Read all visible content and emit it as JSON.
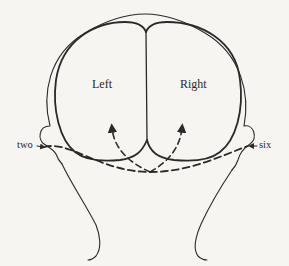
{
  "diagram": {
    "type": "brain-hemispheres-visual-pathways",
    "labels": {
      "left_hemisphere": "Left",
      "right_hemisphere": "Right",
      "left_input": "two",
      "right_input": "six"
    },
    "colors": {
      "background": "#f6f5f1",
      "stroke": "#2a2a2a"
    }
  }
}
